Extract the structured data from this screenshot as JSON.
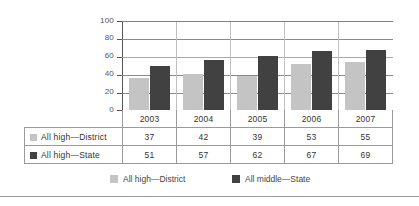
{
  "chart_data": {
    "type": "bar",
    "title": "",
    "xlabel": "",
    "ylabel": "",
    "categories": [
      "2003",
      "2004",
      "2005",
      "2006",
      "2007"
    ],
    "series": [
      {
        "name": "All high—District",
        "legend_name": "All high—District",
        "color": "#c4c4c4",
        "values": [
          37,
          42,
          39,
          53,
          55
        ]
      },
      {
        "name": "All high—State",
        "legend_name": "All middle—State",
        "color": "#414141",
        "values": [
          51,
          57,
          62,
          67,
          69
        ]
      }
    ],
    "ylim": [
      0,
      100
    ],
    "yticks": [
      "0",
      "20",
      "40",
      "60",
      "80",
      "100"
    ],
    "grid": true,
    "legend_position": "bottom"
  },
  "table": {
    "header_row_label": "",
    "years": [
      "2003",
      "2004",
      "2005",
      "2006",
      "2007"
    ],
    "rows": [
      {
        "label": "All high—District",
        "swatch": "district",
        "values": [
          "37",
          "42",
          "39",
          "53",
          "55"
        ]
      },
      {
        "label": "All high—State",
        "swatch": "state",
        "values": [
          "51",
          "57",
          "62",
          "67",
          "69"
        ]
      }
    ]
  },
  "legend": {
    "items": [
      {
        "label": "All high—District",
        "swatch": "district"
      },
      {
        "label": "All middle—State",
        "swatch": "state"
      }
    ]
  },
  "colors": {
    "district": "#c4c4c4",
    "state": "#414141",
    "gridline": "#8a8a8a",
    "axis": "#555555",
    "table_border": "#9a9a9a",
    "text": "#333333",
    "background": "#ffffff"
  }
}
